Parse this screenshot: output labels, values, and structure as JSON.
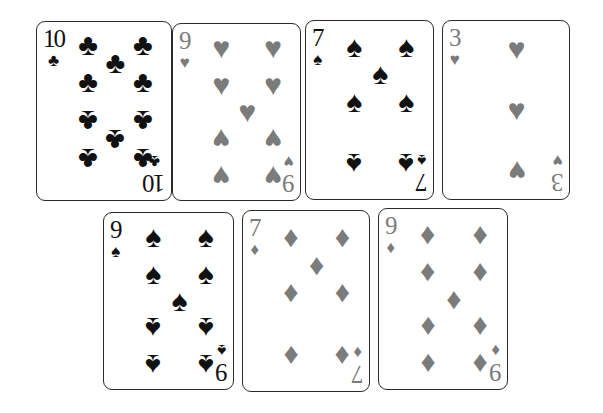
{
  "scene": {
    "title": "Seven playing cards arranged in two rows",
    "background_color": "#ffffff",
    "card_face_color": "#ffffff",
    "card_border_color": "#2b2b2b",
    "black_suit_color": "#111111",
    "gray_suit_color": "#7b7b7b"
  },
  "glyphs": {
    "club": "♣",
    "heart": "♥",
    "spade": "♠",
    "diamond": "♦"
  },
  "rows": [
    {
      "name": "top-row",
      "cards": [
        "card_10_clubs",
        "card_9_hearts",
        "card_7_spades",
        "card_3_hearts"
      ]
    },
    {
      "name": "bottom-row",
      "cards": [
        "card_9_spades",
        "card_7_diamonds",
        "card_9_diamonds"
      ]
    }
  ],
  "cards": {
    "card_10_clubs": {
      "rank": "10",
      "suit": "club",
      "suit_name": "clubs",
      "label": "10 of clubs",
      "color": "black",
      "pip_size": 30,
      "corner_pip_size": 17,
      "x": 36,
      "y": 21,
      "w": 136,
      "h": 180,
      "pips": [
        {
          "x": 22,
          "y": 11,
          "flip": false
        },
        {
          "x": 78,
          "y": 11,
          "flip": false
        },
        {
          "x": 50,
          "y": 22,
          "flip": false
        },
        {
          "x": 22,
          "y": 33,
          "flip": false
        },
        {
          "x": 78,
          "y": 33,
          "flip": false
        },
        {
          "x": 22,
          "y": 56,
          "flip": true
        },
        {
          "x": 78,
          "y": 56,
          "flip": true
        },
        {
          "x": 50,
          "y": 67,
          "flip": true
        },
        {
          "x": 22,
          "y": 78,
          "flip": true
        },
        {
          "x": 78,
          "y": 78,
          "flip": true
        }
      ]
    },
    "card_9_hearts": {
      "rank": "9",
      "suit": "heart",
      "suit_name": "hearts",
      "label": "9 of hearts",
      "color": "gray",
      "pip_size": 30,
      "corner_pip_size": 17,
      "x": 172,
      "y": 23,
      "w": 129,
      "h": 178,
      "pips": [
        {
          "x": 22,
          "y": 12,
          "flip": false
        },
        {
          "x": 78,
          "y": 12,
          "flip": false
        },
        {
          "x": 22,
          "y": 34,
          "flip": false
        },
        {
          "x": 78,
          "y": 34,
          "flip": false
        },
        {
          "x": 50,
          "y": 50,
          "flip": false
        },
        {
          "x": 22,
          "y": 66,
          "flip": true
        },
        {
          "x": 78,
          "y": 66,
          "flip": true
        },
        {
          "x": 22,
          "y": 88,
          "flip": true
        },
        {
          "x": 78,
          "y": 88,
          "flip": true
        }
      ]
    },
    "card_7_spades": {
      "rank": "7",
      "suit": "spade",
      "suit_name": "spades",
      "label": "7 of spades",
      "color": "black",
      "pip_size": 30,
      "corner_pip_size": 17,
      "x": 305,
      "y": 20,
      "w": 129,
      "h": 180,
      "pips": [
        {
          "x": 22,
          "y": 13,
          "flip": false
        },
        {
          "x": 78,
          "y": 13,
          "flip": false
        },
        {
          "x": 50,
          "y": 29,
          "flip": false
        },
        {
          "x": 22,
          "y": 45,
          "flip": false
        },
        {
          "x": 78,
          "y": 45,
          "flip": false
        },
        {
          "x": 22,
          "y": 82,
          "flip": true
        },
        {
          "x": 78,
          "y": 82,
          "flip": true
        }
      ]
    },
    "card_3_hearts": {
      "rank": "3",
      "suit": "heart",
      "suit_name": "hearts",
      "label": "3 of hearts",
      "color": "gray",
      "pip_size": 30,
      "corner_pip_size": 17,
      "x": 442,
      "y": 20,
      "w": 128,
      "h": 180,
      "pips": [
        {
          "x": 50,
          "y": 14,
          "flip": false
        },
        {
          "x": 50,
          "y": 50,
          "flip": false
        },
        {
          "x": 50,
          "y": 86,
          "flip": true
        }
      ]
    },
    "card_9_spades": {
      "rank": "9",
      "suit": "spade",
      "suit_name": "spades",
      "label": "9 of spades",
      "color": "black",
      "pip_size": 30,
      "corner_pip_size": 17,
      "x": 103,
      "y": 212,
      "w": 131,
      "h": 178,
      "pips": [
        {
          "x": 22,
          "y": 12,
          "flip": false
        },
        {
          "x": 78,
          "y": 12,
          "flip": false
        },
        {
          "x": 22,
          "y": 34,
          "flip": false
        },
        {
          "x": 78,
          "y": 34,
          "flip": false
        },
        {
          "x": 50,
          "y": 50,
          "flip": false
        },
        {
          "x": 22,
          "y": 66,
          "flip": true
        },
        {
          "x": 78,
          "y": 66,
          "flip": true
        },
        {
          "x": 22,
          "y": 88,
          "flip": true
        },
        {
          "x": 78,
          "y": 88,
          "flip": true
        }
      ]
    },
    "card_7_diamonds": {
      "rank": "7",
      "suit": "diamond",
      "suit_name": "diamonds",
      "label": "7 of diamonds",
      "color": "gray",
      "pip_size": 30,
      "corner_pip_size": 17,
      "x": 242,
      "y": 210,
      "w": 128,
      "h": 182,
      "pips": [
        {
          "x": 22,
          "y": 13,
          "flip": false
        },
        {
          "x": 78,
          "y": 13,
          "flip": false
        },
        {
          "x": 50,
          "y": 29,
          "flip": false
        },
        {
          "x": 22,
          "y": 45,
          "flip": false
        },
        {
          "x": 78,
          "y": 45,
          "flip": false
        },
        {
          "x": 22,
          "y": 82,
          "flip": true
        },
        {
          "x": 78,
          "y": 82,
          "flip": true
        }
      ]
    },
    "card_9_diamonds": {
      "rank": "9",
      "suit": "diamond",
      "suit_name": "diamonds",
      "label": "9 of diamonds",
      "color": "gray",
      "pip_size": 30,
      "corner_pip_size": 17,
      "x": 378,
      "y": 208,
      "w": 130,
      "h": 182,
      "pips": [
        {
          "x": 22,
          "y": 12,
          "flip": false
        },
        {
          "x": 78,
          "y": 12,
          "flip": false
        },
        {
          "x": 22,
          "y": 34,
          "flip": false
        },
        {
          "x": 78,
          "y": 34,
          "flip": false
        },
        {
          "x": 50,
          "y": 50,
          "flip": false
        },
        {
          "x": 22,
          "y": 66,
          "flip": true
        },
        {
          "x": 78,
          "y": 66,
          "flip": true
        },
        {
          "x": 22,
          "y": 88,
          "flip": true
        },
        {
          "x": 78,
          "y": 88,
          "flip": true
        }
      ]
    }
  }
}
